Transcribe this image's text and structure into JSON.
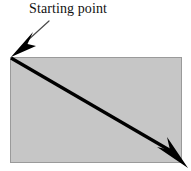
{
  "figure": {
    "background_color": "#ffffff",
    "width": 191,
    "height": 171
  },
  "label": {
    "text": "Starting point",
    "color": "#111111",
    "font_size_px": 14,
    "x": 29,
    "y": 1
  },
  "leader_line": {
    "name": "callout-leader-line",
    "color": "#4a4a4a",
    "stroke_width": 1.2,
    "x1": 49,
    "y1": 21,
    "x2": 27,
    "y2": 41
  },
  "callout_arrowhead": {
    "name": "callout-arrowhead",
    "color": "#000000",
    "tip_x": 11,
    "tip_y": 57,
    "points": "11,57 32,33 27,43 35,46"
  },
  "rectangle": {
    "name": "shaded-rectangle",
    "fill_color": "#c6c6c6",
    "border_color": "#9a9a9a",
    "border_width": 1,
    "x": 10,
    "y": 57,
    "width": 172,
    "height": 106
  },
  "diagonal_arrow": {
    "name": "diagonal-direction-arrow",
    "color": "#000000",
    "stroke_width": 3.2,
    "x1": 11,
    "y1": 58,
    "x2": 171,
    "y2": 151,
    "tip_x": 187,
    "tip_y": 167,
    "head_points": "187,167 159,148 171,151 168,140"
  }
}
